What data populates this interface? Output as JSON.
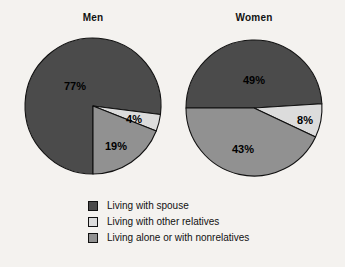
{
  "chart_data": {
    "type": "pie",
    "title": "",
    "charts": [
      {
        "title": "Men",
        "categories": [
          "Living with spouse",
          "Living with other relatives",
          "Living alone or with nonrelatives"
        ],
        "values": [
          77,
          19,
          4
        ],
        "labels": [
          "77%",
          "4%",
          "19%"
        ]
      },
      {
        "title": "Women",
        "categories": [
          "Living with spouse",
          "Living with other relatives",
          "Living alone or with nonrelatives"
        ],
        "values": [
          49,
          43,
          8
        ],
        "labels": [
          "49%",
          "8%",
          "43%"
        ]
      }
    ],
    "legend": [
      {
        "label": "Living with spouse",
        "color": "#4b4b4b"
      },
      {
        "label": "Living with other relatives",
        "color": "#dcdcdc"
      },
      {
        "label": "Living alone or with nonrelatives",
        "color": "#919191"
      }
    ],
    "legend_position": "bottom",
    "units": "percent"
  },
  "colors": {
    "spouse": "#4b4b4b",
    "other_relatives": "#dcdcdc",
    "alone_or_nonrelatives": "#919191",
    "outline": "#111111",
    "background": "#f4f2ef",
    "text": "#111111"
  },
  "men": {
    "title": "Men",
    "spouse_pct": "77%",
    "other_relatives_pct": "4%",
    "alone_pct": "19%"
  },
  "women": {
    "title": "Women",
    "spouse_pct": "49%",
    "other_relatives_pct": "8%",
    "alone_pct": "43%"
  },
  "legend": {
    "items": [
      {
        "label": "Living with spouse"
      },
      {
        "label": "Living with other relatives"
      },
      {
        "label": "Living alone or with nonrelatives"
      }
    ]
  }
}
